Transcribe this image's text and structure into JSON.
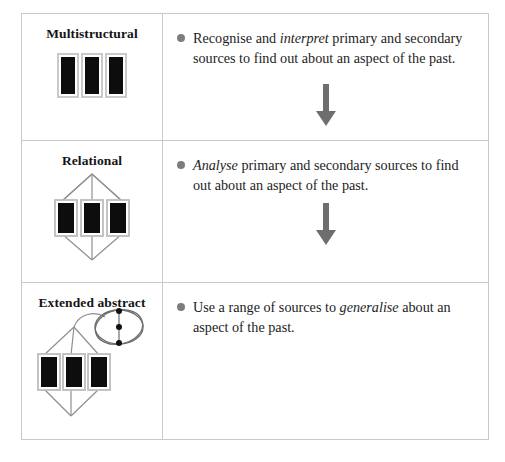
{
  "table": {
    "title": "SOLO taxonomy levels for historical inquiry",
    "columns": [
      "Level",
      "Learning outcome"
    ],
    "rows": [
      {
        "level_label": "Multistructural",
        "icon": "three-bars-icon",
        "bullet": {
          "lead": "Recognise and ",
          "emphasis": "interpret",
          "tail": " primary and secondary sources to find out about an aspect of the past."
        },
        "arrow": "down-arrow-icon"
      },
      {
        "level_label": "Relational",
        "icon": "three-bars-linked-icon",
        "bullet": {
          "lead": "",
          "emphasis": "Analyse",
          "tail": " primary and secondary sources to find out about an aspect of the past."
        },
        "arrow": "down-arrow-icon"
      },
      {
        "level_label": "Extended abstract",
        "icon": "three-bars-linked-extended-icon",
        "bullet": {
          "lead": "Use a range of sources to ",
          "emphasis": "generalise",
          "tail": " about an aspect of the past."
        },
        "arrow": null
      }
    ]
  },
  "colors": {
    "border": "#c9c9c9",
    "bullet": "#7d7d7d",
    "arrow": "#6e6e6e",
    "bar_fill": "#0d0d0d",
    "bar_outline": "#b5b5b5",
    "text": "#1d1d1d"
  }
}
